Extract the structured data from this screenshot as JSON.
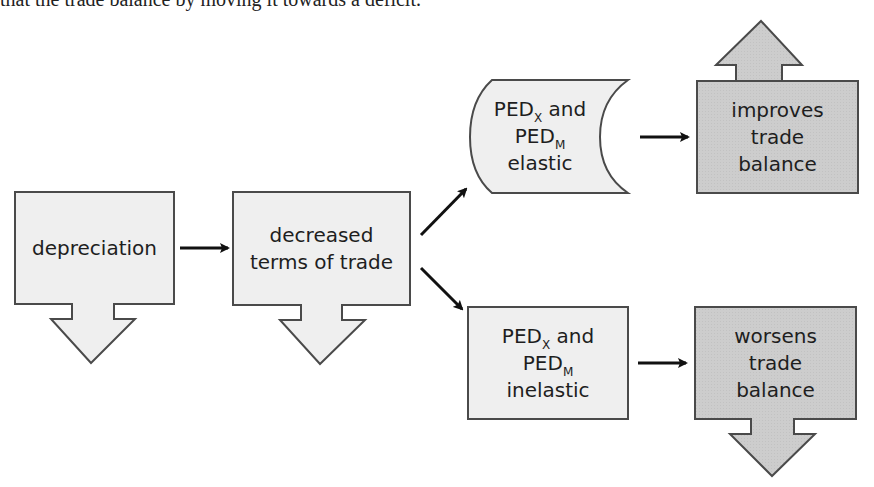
{
  "caption": "that the trade balance by moving it towards a deficit.",
  "colors": {
    "light_fill": "#eeeeee",
    "dark_fill": "#cfcfcf",
    "stroke": "#4a4a4a",
    "arrow": "#111111"
  },
  "nodes": {
    "depreciation": {
      "label": "depreciation",
      "direction": "down"
    },
    "terms_of_trade": {
      "line1": "decreased",
      "line2": "terms of trade",
      "direction": "down"
    },
    "elastic": {
      "ped": "PED",
      "sub_x": "X",
      "and": " and",
      "sub_m": "M",
      "state": "elastic"
    },
    "inelastic": {
      "ped": "PED",
      "sub_x": "X",
      "and": " and",
      "sub_m": "M",
      "state": "inelastic"
    },
    "improves": {
      "line1": "improves",
      "line2": "trade",
      "line3": "balance",
      "direction": "up"
    },
    "worsens": {
      "line1": "worsens",
      "line2": "trade",
      "line3": "balance",
      "direction": "down"
    }
  },
  "edges": [
    {
      "from": "depreciation",
      "to": "terms_of_trade"
    },
    {
      "from": "terms_of_trade",
      "to": "elastic"
    },
    {
      "from": "terms_of_trade",
      "to": "inelastic"
    },
    {
      "from": "elastic",
      "to": "improves"
    },
    {
      "from": "inelastic",
      "to": "worsens"
    }
  ]
}
